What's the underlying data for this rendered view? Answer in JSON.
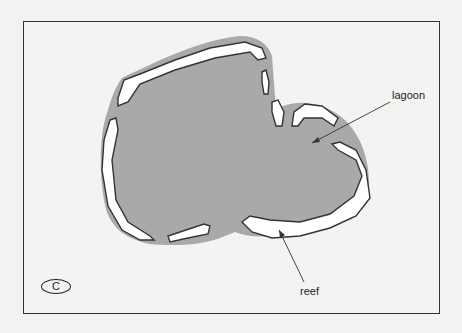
{
  "diagram": {
    "panel_label": "C",
    "labels": {
      "lagoon": "lagoon",
      "reef": "reef"
    },
    "colors": {
      "lagoon_fill": "#a9a9a9",
      "reef_fill": "#ffffff",
      "outline": "#333333",
      "background": "#f3f3f2"
    }
  }
}
